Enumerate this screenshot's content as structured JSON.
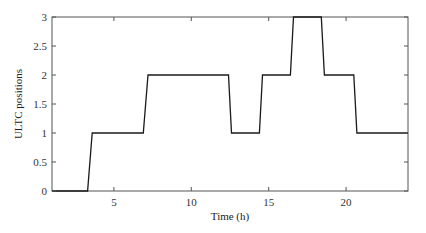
{
  "chart_data": {
    "type": "line",
    "title": "",
    "xlabel": "Time (h)",
    "ylabel": "ULTC positions",
    "xlim": [
      1,
      24
    ],
    "ylim": [
      0,
      3
    ],
    "xticks": [
      5,
      10,
      15,
      20
    ],
    "xtick_labels": [
      "5",
      "10",
      "15",
      "20"
    ],
    "yticks": [
      0,
      0.5,
      1,
      1.5,
      2,
      2.5,
      3
    ],
    "ytick_labels": [
      "0",
      "0.5",
      "1",
      "1.5",
      "2",
      "2.5",
      "3"
    ],
    "grid": false,
    "legend": null,
    "series": [
      {
        "name": "ULTC position",
        "color": "#1a1a1a",
        "x": [
          1,
          3.3,
          3.6,
          6.9,
          7.2,
          12.4,
          12.6,
          14.4,
          14.6,
          16.4,
          16.6,
          18.4,
          18.6,
          20.5,
          20.7,
          24
        ],
        "y": [
          0,
          0,
          1,
          1,
          2,
          2,
          1,
          1,
          2,
          2,
          3,
          3,
          2,
          2,
          1,
          1
        ]
      }
    ]
  },
  "colors": {
    "axis": "#555555",
    "line": "#1a1a1a",
    "background": "#ffffff"
  }
}
